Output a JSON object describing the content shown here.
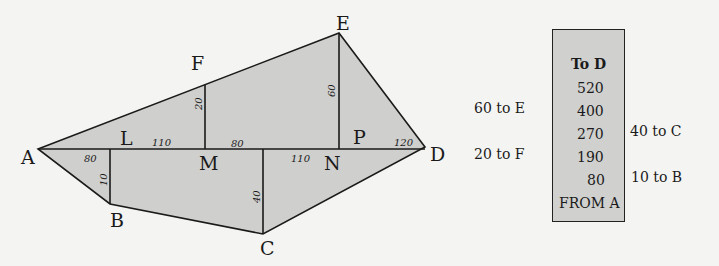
{
  "diagram": {
    "vertices": {
      "A": "A",
      "B": "B",
      "C": "C",
      "D": "D",
      "E": "E",
      "F": "F",
      "L": "L",
      "M": "M",
      "N": "N",
      "P": "P"
    },
    "measurements": {
      "AL": "80",
      "LM": "110",
      "M_to_C": "80",
      "C_to_N": "110",
      "PD": "120",
      "LB": "10",
      "MF": "20",
      "NE": "60",
      "C_offset": "40"
    },
    "fill_color": "#cfcfcd",
    "stroke_color": "#1a1a1a"
  },
  "field_book": {
    "header": "To D",
    "footer": "FROM A",
    "chainages": [
      "520",
      "400",
      "270",
      "190",
      "80"
    ],
    "left_offsets": [
      {
        "row": 1,
        "text": "60 to E"
      },
      {
        "row": 3,
        "text": "20 to F"
      }
    ],
    "right_offsets": [
      {
        "row": 2,
        "text": "40 to C"
      },
      {
        "row": 4,
        "text": "10 to B"
      }
    ]
  }
}
